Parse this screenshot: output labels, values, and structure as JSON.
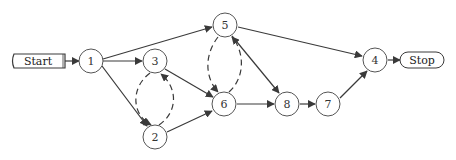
{
  "diagram": {
    "type": "directed-graph",
    "colors": {
      "stroke": "#3a3a3a",
      "node_fill": "#ffffff",
      "background": "#ffffff"
    },
    "start": {
      "label": "Start",
      "x": 12,
      "y": 54,
      "w": 53,
      "h": 14
    },
    "stop": {
      "label": "Stop",
      "x": 400,
      "y": 52,
      "w": 44,
      "h": 16
    },
    "nodes": [
      {
        "id": "1",
        "label": "1",
        "cx": 91,
        "cy": 61
      },
      {
        "id": "3",
        "label": "3",
        "cx": 155,
        "cy": 61
      },
      {
        "id": "5",
        "label": "5",
        "cx": 225,
        "cy": 25
      },
      {
        "id": "6",
        "label": "6",
        "cx": 224,
        "cy": 104
      },
      {
        "id": "2",
        "label": "2",
        "cx": 155,
        "cy": 137
      },
      {
        "id": "8",
        "label": "8",
        "cx": 287,
        "cy": 104
      },
      {
        "id": "7",
        "label": "7",
        "cx": 328,
        "cy": 104
      },
      {
        "id": "4",
        "label": "4",
        "cx": 375,
        "cy": 60
      }
    ],
    "edges": [
      {
        "from": "Start",
        "to": "1",
        "style": "solid"
      },
      {
        "from": "1",
        "to": "5",
        "style": "solid"
      },
      {
        "from": "1",
        "to": "3",
        "style": "solid"
      },
      {
        "from": "1",
        "to": "2",
        "style": "solid"
      },
      {
        "from": "3",
        "to": "6",
        "style": "solid"
      },
      {
        "from": "2",
        "to": "6",
        "style": "solid"
      },
      {
        "from": "3",
        "to": "2",
        "style": "dashed"
      },
      {
        "from": "2",
        "to": "3",
        "style": "dashed"
      },
      {
        "from": "5",
        "to": "6",
        "style": "dashed"
      },
      {
        "from": "6",
        "to": "5",
        "style": "dashed"
      },
      {
        "from": "5",
        "to": "4",
        "style": "solid"
      },
      {
        "from": "5",
        "to": "8",
        "style": "solid"
      },
      {
        "from": "6",
        "to": "8",
        "style": "solid"
      },
      {
        "from": "8",
        "to": "7",
        "style": "solid"
      },
      {
        "from": "7",
        "to": "4",
        "style": "solid"
      },
      {
        "from": "4",
        "to": "Stop",
        "style": "solid"
      }
    ]
  }
}
